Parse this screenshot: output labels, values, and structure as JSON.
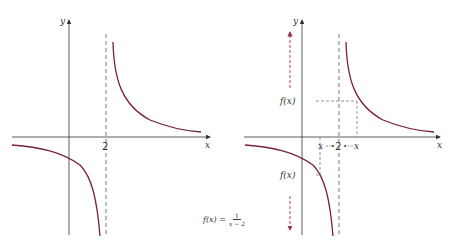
{
  "figure": {
    "left_graph": {
      "y_axis_label": "y",
      "x_axis_label": "x",
      "asymptote_label": "2"
    },
    "right_graph": {
      "y_axis_label": "y",
      "x_axis_label": "x",
      "asymptote_label": "2",
      "upper_value_label": "f(x)",
      "lower_value_label": "f(x)",
      "left_x_label": "x",
      "right_x_label": "x"
    },
    "formula": {
      "lhs": "f(x) =",
      "numerator": "1",
      "denominator": "x − 2"
    },
    "colors": {
      "curve": "#7a1f3d",
      "axes": "#333333",
      "dashed": "#555555",
      "arrow": "#a0304f"
    }
  }
}
